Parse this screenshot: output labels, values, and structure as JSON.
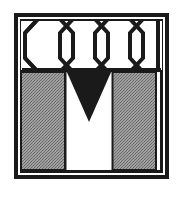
{
  "canvas": {
    "width": 182,
    "height": 198,
    "background_color": "#ffffff"
  },
  "emblem": {
    "title": "Monogram M Emblem",
    "description": "Square double-ruled frame containing a honeycomb hexagon band across the top, two gray halftone vertical columns below, and a solid black downward-pointing triangle centered between the columns forming a letter M.",
    "ink_color": "#1a1a1a",
    "paper_color": "#ffffff",
    "halftone_color": "#9a9a9a",
    "halftone_dot_color": "#6e6e6e",
    "frame": {
      "name": "double-rule-border",
      "outer_rect": {
        "x": 14,
        "y": 13,
        "width": 155,
        "height": 166
      },
      "outer_stroke_width": 4,
      "gap": 3,
      "inner_stroke_width": 3,
      "corner_style": "square"
    },
    "hex_band": {
      "name": "honeycomb-band",
      "x": 21,
      "y": 21,
      "width": 141,
      "height": 49,
      "full_hexagon_count": 3,
      "partial_hexagon_count": 2,
      "stroke_width": 4,
      "fill": "#ffffff",
      "stroke": "#1a1a1a"
    },
    "divider": {
      "name": "horizontal-divider",
      "y": 70,
      "x1": 21,
      "x2": 162,
      "stroke_width": 4
    },
    "columns": [
      {
        "name": "left-column",
        "x": 20,
        "y": 72,
        "width": 45,
        "height": 98,
        "fill": "#9a9a9a",
        "stroke": "#1a1a1a",
        "stroke_width": 2
      },
      {
        "name": "right-column",
        "x": 112,
        "y": 72,
        "width": 45,
        "height": 98,
        "fill": "#9a9a9a",
        "stroke": "#1a1a1a",
        "stroke_width": 2
      }
    ],
    "triangle": {
      "name": "black-triangle",
      "direction": "down",
      "left_x": 67,
      "right_x": 112,
      "top_y": 70,
      "apex_x": 89,
      "apex_y": 122,
      "fill": "#1a1a1a"
    },
    "center_gap": {
      "name": "center-channel",
      "x": 65,
      "y": 72,
      "width": 47,
      "height": 98,
      "fill": "#ffffff"
    }
  }
}
